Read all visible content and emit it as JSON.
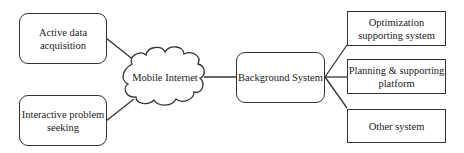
{
  "diagram": {
    "inputs": [
      {
        "id": "active",
        "label": "Active data acquisition"
      },
      {
        "id": "interactive",
        "label": "Interactive problem seeking"
      }
    ],
    "hub": {
      "label": "Mobile Internet",
      "shape": "cloud"
    },
    "core": {
      "label": "Background System"
    },
    "outputs": [
      {
        "id": "optimization",
        "label": "Optimization supporting system"
      },
      {
        "id": "planning",
        "label": "Planning & supporting platform"
      },
      {
        "id": "other",
        "label": "Other system"
      }
    ],
    "edges": [
      [
        "active",
        "hub"
      ],
      [
        "interactive",
        "hub"
      ],
      [
        "hub",
        "core"
      ],
      [
        "core",
        "optimization"
      ],
      [
        "core",
        "planning"
      ],
      [
        "core",
        "other"
      ]
    ],
    "colors": {
      "stroke": "#333333",
      "fill": "#ffffff"
    }
  }
}
